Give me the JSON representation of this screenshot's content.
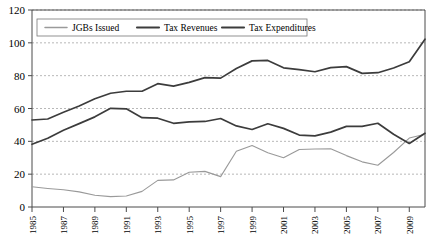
{
  "chart_data": {
    "type": "line",
    "title": "",
    "subtitle": "",
    "xlabel": "",
    "ylabel": "",
    "ylim": [
      0,
      120
    ],
    "ytick_labels": [
      "0",
      "20",
      "40",
      "60",
      "80",
      "100",
      "120"
    ],
    "ytick_values": [
      0,
      20,
      40,
      60,
      80,
      100,
      120
    ],
    "xlim": [
      1985,
      2010
    ],
    "xtick_labels": [
      "1985",
      "1987",
      "1989",
      "1991",
      "1993",
      "1995",
      "1997",
      "1999",
      "2001",
      "2003",
      "2005",
      "2007",
      "2009"
    ],
    "xtick_values": [
      1985,
      1987,
      1989,
      1991,
      1993,
      1995,
      1997,
      1999,
      2001,
      2003,
      2005,
      2007,
      2009
    ],
    "x": [
      1985,
      1986,
      1987,
      1988,
      1989,
      1990,
      1991,
      1992,
      1993,
      1994,
      1995,
      1996,
      1997,
      1998,
      1999,
      2000,
      2001,
      2002,
      2003,
      2004,
      2005,
      2006,
      2007,
      2008,
      2009,
      2010
    ],
    "grid": true,
    "grid_axis": "y",
    "legend_position": "top",
    "series": [
      {
        "name": "JGBs Issued",
        "color": "#9a9a9a",
        "width": 1.1,
        "values": [
          12.3,
          11.3,
          10.5,
          9.2,
          7.2,
          6.3,
          6.7,
          9.5,
          16.2,
          16.5,
          21.2,
          21.7,
          18.5,
          34.0,
          37.5,
          33.0,
          30.0,
          35.0,
          35.3,
          35.5,
          31.3,
          27.5,
          25.4,
          33.2,
          42.0,
          44.3
        ]
      },
      {
        "name": "Tax Revenues",
        "color": "#3c3c3c",
        "width": 1.7,
        "values": [
          38.2,
          41.9,
          46.8,
          50.8,
          54.9,
          60.1,
          59.8,
          54.4,
          54.1,
          51.0,
          51.9,
          52.1,
          53.9,
          49.4,
          47.2,
          50.7,
          47.9,
          43.8,
          43.3,
          45.6,
          49.1,
          49.1,
          51.0,
          44.3,
          38.7,
          44.9
        ]
      },
      {
        "name": "Tax Expenditures",
        "color": "#3c3c3c",
        "width": 1.7,
        "values": [
          53.0,
          53.6,
          57.7,
          61.5,
          65.9,
          69.3,
          70.5,
          70.5,
          75.1,
          73.6,
          75.9,
          78.8,
          78.5,
          84.4,
          89.0,
          89.3,
          84.8,
          83.7,
          82.4,
          84.9,
          85.5,
          81.4,
          81.8,
          84.7,
          88.5,
          102.2
        ]
      }
    ]
  },
  "legend": {
    "items": [
      {
        "label": "JGBs Issued"
      },
      {
        "label": "Tax Revenues"
      },
      {
        "label": "Tax Expenditures"
      }
    ]
  }
}
